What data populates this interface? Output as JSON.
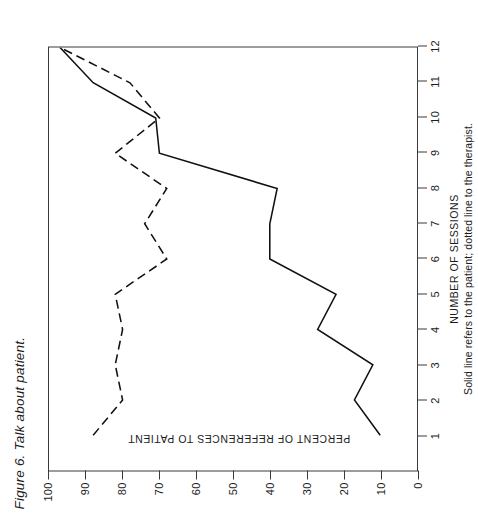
{
  "figure": {
    "title": "Figure 6. Talk about patient.",
    "caption": "Solid line refers to the patient; dotted line to the therapist."
  },
  "chart_data": {
    "type": "line",
    "title": "Figure 6. Talk about patient.",
    "subtitle": "Solid line refers to the patient; dotted line to the therapist.",
    "xlabel": "NUMBER OF SESSIONS",
    "ylabel": "PERCENT OF REFERENCES TO PATIENT",
    "xlim": [
      0,
      12
    ],
    "ylim": [
      0,
      100
    ],
    "grid": false,
    "legend": "none",
    "x": [
      1,
      2,
      3,
      4,
      5,
      6,
      7,
      8,
      9,
      10,
      11,
      12
    ],
    "xticklabels": [
      "1",
      "2",
      "3",
      "4",
      "5",
      "6",
      "7",
      "8",
      "9",
      "10",
      "11",
      "12"
    ],
    "yticks": [
      0,
      10,
      20,
      30,
      40,
      50,
      60,
      70,
      80,
      90,
      100
    ],
    "yticklabels": [
      "0",
      "10",
      "20",
      "30",
      "40",
      "50",
      "60",
      "70",
      "80",
      "90",
      "100"
    ],
    "series": [
      {
        "name": "patient",
        "style": "solid",
        "description": "Solid line refers to the patient",
        "values": [
          10,
          17,
          12,
          27,
          22,
          40,
          40,
          38,
          70,
          71,
          88,
          97
        ]
      },
      {
        "name": "therapist",
        "style": "dotted",
        "description": "dotted line to the therapist",
        "values": [
          88,
          80,
          82,
          80,
          82,
          68,
          74,
          68,
          82,
          70,
          78,
          97
        ]
      }
    ]
  }
}
